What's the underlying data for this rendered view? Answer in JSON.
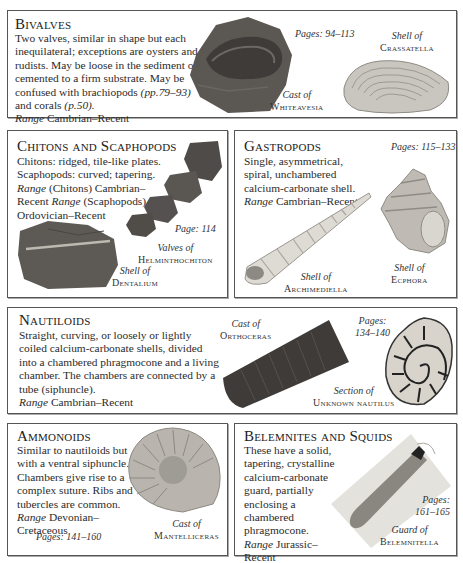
{
  "sections": {
    "bivalves": {
      "title": "Bivalves",
      "text": "Two valves, similar in shape but each inequilateral; exceptions are oysters and rudists. May be loose in the sediment or cemented to a firm substrate. May be confused with brachiopods",
      "ref1": "(pp.79–93)",
      "and": " and corals ",
      "ref2": "(p.50).",
      "range_label": "Range",
      "range": " Cambrian–Recent",
      "pages": "Pages: 94–113",
      "captions": [
        {
          "kind": "Cast of",
          "name": "Whiteavesia"
        },
        {
          "kind": "Shell of",
          "name": "Crassatella"
        }
      ]
    },
    "chitons": {
      "title": "Chitons and Scaphopods",
      "text": "Chitons: ridged, tile-like plates. Scaphopods: curved; tapering.",
      "range_label_1": "Range",
      "range_1": " (Chitons) Cambrian–Recent ",
      "range_label_2": "Range",
      "range_2": " (Scaphopods) Ordovician–Recent",
      "pages": "Page: 114",
      "captions": [
        {
          "kind": "Valves of",
          "name": "Helminthochiton"
        },
        {
          "kind": "Shell of",
          "name": "Dentalium"
        }
      ]
    },
    "gastropods": {
      "title": "Gastropods",
      "text": "Single, asymmetrical, spiral, unchambered calcium-carbonate shell.",
      "range_label": "Range",
      "range": " Cambrian–Recent",
      "pages": "Pages: 115–133",
      "captions": [
        {
          "kind": "Shell of",
          "name": "Archimediella"
        },
        {
          "kind": "Shell of",
          "name": "Ecphora"
        }
      ]
    },
    "nautiloids": {
      "title": "Nautiloids",
      "text": "Straight, curving, or loosely or lightly coiled calcium-carbonate shells, divided into a chambered phragmocone and a living chamber. The chambers are connected by a tube (siphuncle).",
      "range_label": "Range",
      "range": " Cambrian–Recent",
      "pages_1": "Pages:",
      "pages_2": "134–140",
      "captions": [
        {
          "kind": "Cast of",
          "name": "Orthoceras"
        },
        {
          "kind": "Section of",
          "name": "Unknown nautilus"
        }
      ]
    },
    "ammonoids": {
      "title": "Ammonoids",
      "text": "Similar to nautiloids but with a ventral siphuncle. Chambers give rise to a complex suture. Ribs and tubercles are common.",
      "range_label": "Range",
      "range": " Devonian–Cretaceous",
      "pages": "Pages: 141–160",
      "captions": [
        {
          "kind": "Cast of",
          "name": "Mantelliceras"
        }
      ]
    },
    "belemnites": {
      "title": "Belemnites and Squids",
      "text": "These have a solid, tapering, crystalline calcium-carbonate guard, partially enclosing a chambered phragmocone.",
      "range_label": "Range",
      "range": " Jurassic–Recent",
      "pages_1": "Pages:",
      "pages_2": "161–165",
      "captions": [
        {
          "kind": "Guard of",
          "name": "Belemnitella"
        }
      ]
    }
  },
  "colors": {
    "border": "#555555",
    "text": "#2a2a2a",
    "rock": "#5a5550",
    "shell": "#c9c6bf"
  }
}
